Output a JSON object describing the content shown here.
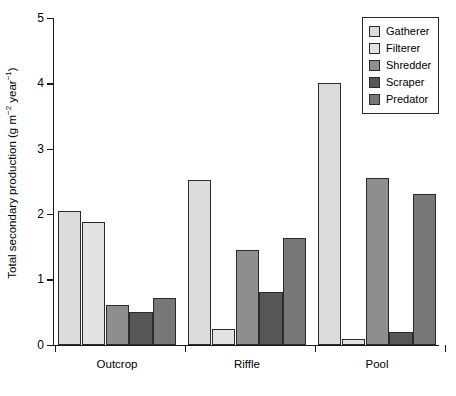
{
  "chart_data": {
    "type": "bar",
    "title": "",
    "subtitle": "",
    "xlabel": "",
    "ylabel": "Total secondary production (g m⁻² year⁻¹)",
    "ylabel_parts": {
      "before": "Total secondary production (g m",
      "sup1": "−2",
      "middle": " year",
      "sup2": "−1",
      "after": ")"
    },
    "categories": [
      "Outcrop",
      "Riffle",
      "Pool"
    ],
    "ylim": [
      0,
      5
    ],
    "yticks": [
      0,
      1,
      2,
      3,
      4,
      5
    ],
    "ytick_labels": [
      "0",
      "1",
      "2",
      "3",
      "4",
      "5"
    ],
    "grid": false,
    "legend_position": "top-right",
    "series": [
      {
        "name": "Gatherer",
        "color": "#dcdcdc",
        "values": [
          2.04,
          2.52,
          4.01
        ]
      },
      {
        "name": "Filterer",
        "color": "#e2e2e2",
        "values": [
          1.87,
          0.24,
          0.08
        ]
      },
      {
        "name": "Shredder",
        "color": "#8e8e8e",
        "values": [
          0.6,
          1.45,
          2.55
        ]
      },
      {
        "name": "Scraper",
        "color": "#565656",
        "values": [
          0.5,
          0.81,
          0.2
        ]
      },
      {
        "name": "Predator",
        "color": "#777777",
        "values": [
          0.72,
          1.64,
          2.3
        ]
      }
    ]
  },
  "legend": {
    "items": [
      {
        "label": "Gatherer",
        "color": "#dcdcdc"
      },
      {
        "label": "Filterer",
        "color": "#e2e2e2"
      },
      {
        "label": "Shredder",
        "color": "#8e8e8e"
      },
      {
        "label": "Scraper",
        "color": "#565656"
      },
      {
        "label": "Predator",
        "color": "#777777"
      }
    ]
  }
}
